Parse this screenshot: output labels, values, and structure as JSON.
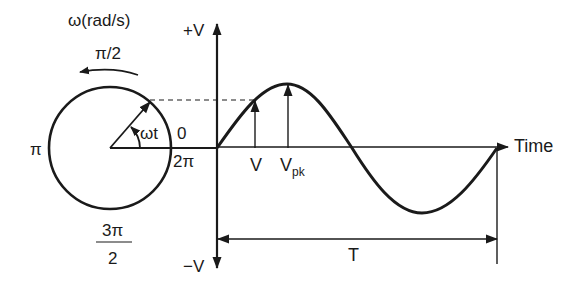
{
  "diagram": {
    "type": "phasor-sine-wave",
    "phasor": {
      "rotation_label": "ω(rad/s)",
      "angle_label": "ωt",
      "angles": {
        "zero": "0",
        "half_pi": "π/2",
        "pi": "π",
        "three_half_pi_num": "3π",
        "three_half_pi_den": "2",
        "two_pi": "2π"
      }
    },
    "axes": {
      "y_positive": "+V",
      "y_negative": "−V",
      "x_label": "Time"
    },
    "waveform": {
      "instant_value_label": "V",
      "peak_label_main": "V",
      "peak_label_sub": "pk",
      "period_label": "T"
    },
    "colors": {
      "stroke": "#1a1a1a",
      "background": "#ffffff"
    }
  }
}
